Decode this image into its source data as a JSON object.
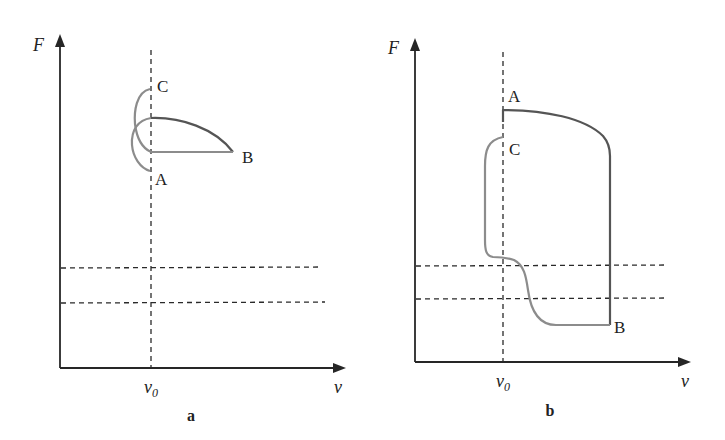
{
  "figure": {
    "panels": [
      {
        "id": "a",
        "caption": "a",
        "y_axis_label": "F",
        "x_axis_label": "v",
        "x_tick_label": "v",
        "x_tick_subscript": "0",
        "points": [
          {
            "name": "C",
            "label": "C"
          },
          {
            "name": "A",
            "label": "A"
          },
          {
            "name": "B",
            "label": "B"
          }
        ]
      },
      {
        "id": "b",
        "caption": "b",
        "y_axis_label": "F",
        "x_axis_label": "v",
        "x_tick_label": "v",
        "x_tick_subscript": "0",
        "points": [
          {
            "name": "A",
            "label": "A"
          },
          {
            "name": "C",
            "label": "C"
          },
          {
            "name": "B",
            "label": "B"
          }
        ]
      }
    ],
    "colors": {
      "axis": "#262626",
      "curve_dark": "#555555",
      "curve_light": "#8c8c8c",
      "dashed": "#2a2a2a",
      "background": "#ffffff"
    }
  }
}
